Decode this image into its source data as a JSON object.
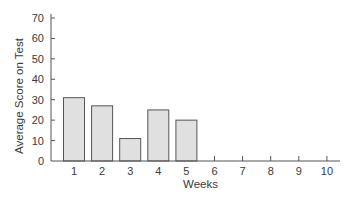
{
  "chart_data": {
    "type": "bar",
    "title": "",
    "xlabel": "Weeks",
    "ylabel": "Average Score on Test",
    "categories": [
      "1",
      "2",
      "3",
      "4",
      "5",
      "6",
      "7",
      "8",
      "9",
      "10"
    ],
    "values": [
      31,
      27,
      11,
      25,
      20,
      null,
      null,
      null,
      null,
      null
    ],
    "ylim": [
      0,
      70
    ],
    "yticks": [
      0,
      10,
      20,
      30,
      40,
      50,
      60,
      70
    ],
    "xticks": [
      1,
      2,
      3,
      4,
      5,
      6,
      7,
      8,
      9,
      10
    ],
    "grid": false,
    "legend": null,
    "colors": {
      "bar_fill": "#e0e0e0",
      "bar_stroke": "#555555",
      "axis": "#555555",
      "text": "#3a3a3a"
    }
  }
}
